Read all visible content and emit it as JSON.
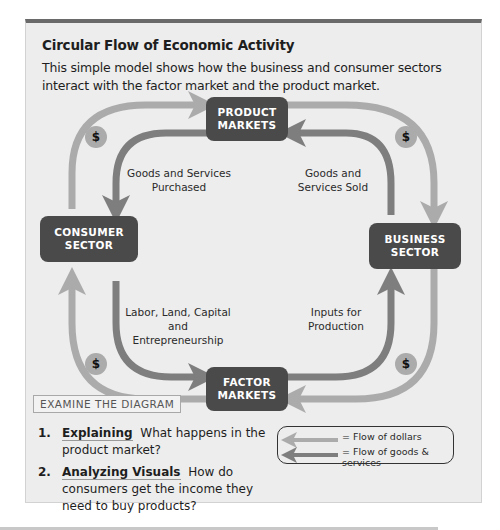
{
  "panel": {
    "title": "Circular Flow of Economic Activity",
    "subtitle": "This simple model shows how the business and consumer sectors interact with the factor market and the product market."
  },
  "diagram": {
    "nodes": {
      "product_markets": "PRODUCT MARKETS",
      "consumer_sector": "CONSUMER SECTOR",
      "business_sector": "BUSINESS SECTOR",
      "factor_markets": "FACTOR MARKETS"
    },
    "flow_labels": {
      "goods_purchased": "Goods and Services Purchased",
      "goods_sold": "Goods and Services Sold",
      "labor": "Labor, Land, Capital and Entrepreneurship",
      "inputs": "Inputs for Production"
    },
    "dollar_symbol": "$",
    "colors": {
      "dollar_flow": "#ababab",
      "goods_flow": "#7e7e7e",
      "node_fill": "#4a4a4a",
      "node_text": "#ffffff"
    }
  },
  "legend": {
    "dollars": "= Flow of dollars",
    "goods": "= Flow of goods & services"
  },
  "examine": {
    "heading": "EXAMINE THE DIAGRAM",
    "questions": [
      {
        "number": "1.",
        "keyword": "Explaining",
        "text": "What happens in the product market?"
      },
      {
        "number": "2.",
        "keyword": "Analyzing Visuals",
        "text": "How do consumers get the income they need to buy products?"
      }
    ]
  }
}
